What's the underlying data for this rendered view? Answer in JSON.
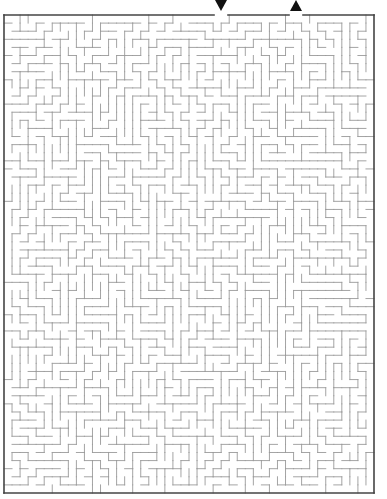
{
  "maze": {
    "type": "rectangular-grid-maze",
    "bounds": {
      "left": 4,
      "top": 15,
      "right": 374,
      "bottom": 493
    },
    "cols": 46,
    "rows": 59,
    "wall_color": "#9a9a9a",
    "border_color": "#444444",
    "entrance": {
      "label": "start",
      "marker": "down-arrow",
      "x": 221,
      "gap_from": 214,
      "gap_to": 228
    },
    "exit": {
      "label": "finish",
      "marker": "up-arrow",
      "x": 296,
      "gap_from": 289,
      "gap_to": 303
    },
    "seed": 7
  }
}
